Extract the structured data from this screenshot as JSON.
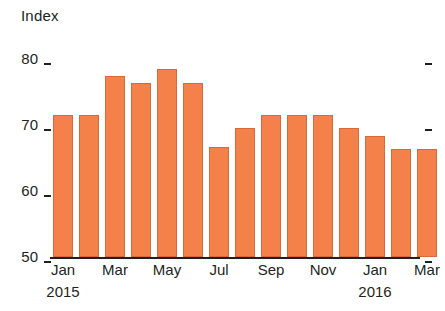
{
  "chart_data": {
    "type": "bar",
    "title": "",
    "ylabel": "Index",
    "xlabel": "",
    "ylim": [
      50,
      80
    ],
    "yticks": [
      50,
      60,
      70,
      80
    ],
    "grid": false,
    "legend": false,
    "bar_color": "#F4814A",
    "bar_edge_color": "#D96A38",
    "axis_color": "#231F20",
    "categories": [
      "Jan",
      "Feb",
      "Mar",
      "Apr",
      "May",
      "Jun",
      "Jul",
      "Aug",
      "Sep",
      "Oct",
      "Nov",
      "Dec",
      "Jan",
      "Feb",
      "Mar"
    ],
    "values": [
      71.5,
      71.5,
      77.5,
      76.3,
      78.5,
      76.4,
      66.6,
      69.6,
      71.5,
      71.5,
      71.5,
      69.6,
      68.4,
      66.4,
      66.4
    ],
    "x_tick_labels": [
      "Jan",
      "Mar",
      "May",
      "Jul",
      "Sep",
      "Nov",
      "Jan",
      "Mar"
    ],
    "x_tick_indices": [
      0,
      2,
      4,
      6,
      8,
      10,
      12,
      14
    ],
    "year_labels": [
      {
        "text": "2015",
        "index": 0
      },
      {
        "text": "2016",
        "index": 12
      }
    ]
  }
}
